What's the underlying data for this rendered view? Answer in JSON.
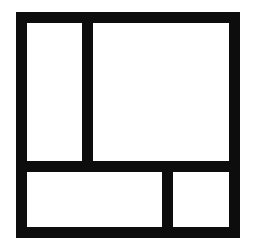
{
  "diagram": {
    "type": "panel-layout",
    "stroke_color": "#0d0d0d",
    "fill_color": "#ffffff",
    "panels": [
      {
        "id": "top-left",
        "label": ""
      },
      {
        "id": "top-right",
        "label": ""
      },
      {
        "id": "bottom-left",
        "label": ""
      },
      {
        "id": "bottom-right",
        "label": ""
      }
    ]
  }
}
